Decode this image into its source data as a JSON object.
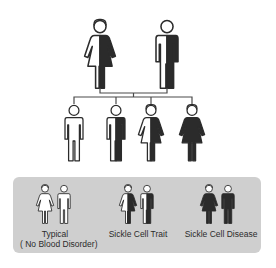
{
  "colors": {
    "affected": "#2b2b2b",
    "unaffected": "#ffffff",
    "outline": "#2b2b2b",
    "legend_bg": "#cfcfcf",
    "connector": "#4a4a4a"
  },
  "parents": [
    {
      "sex": "female",
      "status": "Sickle Cell Trait",
      "fill": "half"
    },
    {
      "sex": "male",
      "status": "Sickle Cell Trait",
      "fill": "half"
    }
  ],
  "children": [
    {
      "sex": "male",
      "status": "Typical",
      "fill": "none"
    },
    {
      "sex": "male",
      "status": "Sickle Cell Trait",
      "fill": "half"
    },
    {
      "sex": "female",
      "status": "Sickle Cell Trait",
      "fill": "half"
    },
    {
      "sex": "female",
      "status": "Sickle Cell Disease",
      "fill": "full"
    }
  ],
  "legend": {
    "items": [
      {
        "label_line1": "Typical",
        "label_line2": "( No Blood Disorder)",
        "fill": "none"
      },
      {
        "label_line1": "Sickle Cell Trait",
        "fill": "half"
      },
      {
        "label_line1": "Sickle Cell Disease",
        "fill": "full"
      }
    ]
  }
}
